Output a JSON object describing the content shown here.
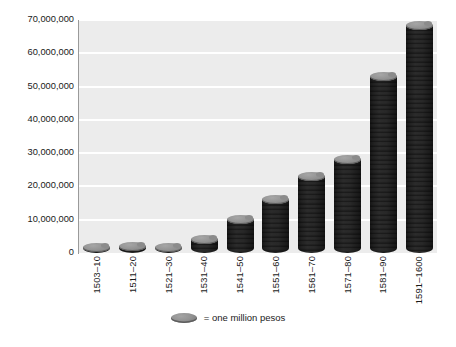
{
  "chart_data": {
    "type": "bar",
    "title": "",
    "subtitle": "",
    "xlabel": "",
    "ylabel": "",
    "ylim": [
      0,
      70000000
    ],
    "grid": true,
    "legend_position": "bottom",
    "categories": [
      "1503–10",
      "1511–20",
      "1521–30",
      "1531–40",
      "1541–50",
      "1551–60",
      "1561–70",
      "1571–80",
      "1581–90",
      "1591–1600"
    ],
    "values": [
      1500000,
      2000000,
      1500000,
      4200000,
      10000000,
      16000000,
      23000000,
      28000000,
      53000000,
      68500000
    ],
    "y_ticks": [
      "0",
      "10,000,000",
      "20,000,000",
      "30,000,000",
      "40,000,000",
      "50,000,000",
      "60,000,000",
      "70,000,000"
    ],
    "y_tick_values": [
      0,
      10000000,
      20000000,
      30000000,
      40000000,
      50000000,
      60000000,
      70000000
    ],
    "legend": [
      {
        "symbol": "coin-stack",
        "label": "= one million pesos"
      }
    ],
    "colors": {
      "plot_background": "#ececec",
      "gridline": "#ffffff",
      "bar_fill": "#7d7d7d",
      "bar_highlight": "#9b9b9b",
      "bar_shadow": "#4f4f4f",
      "axis": "#9a9a9a",
      "text": "#1a1a1a",
      "page_background": "#ffffff"
    }
  }
}
